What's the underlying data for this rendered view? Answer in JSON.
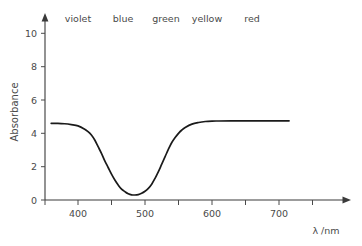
{
  "chart_data": {
    "type": "line",
    "title": "",
    "xlabel": "λ /nm",
    "ylabel": "Absorbance",
    "xlim": [
      355,
      760
    ],
    "ylim": [
      0,
      11
    ],
    "grid": false,
    "legend": null,
    "x_ticks": [
      400,
      500,
      600,
      700
    ],
    "x_tick_labels": [
      "400",
      "500",
      "600",
      "700"
    ],
    "x_minor_ticks": [
      350,
      450,
      550,
      650,
      750
    ],
    "y_ticks": [
      0,
      2,
      4,
      6,
      8,
      10
    ],
    "y_tick_labels": [
      "0",
      "2",
      "4",
      "6",
      "8",
      "10"
    ],
    "series": [
      {
        "name": "absorbance",
        "x": [
          360,
          370,
          380,
          390,
          400,
          410,
          415,
          420,
          425,
          430,
          435,
          440,
          445,
          450,
          455,
          460,
          465,
          470,
          475,
          480,
          485,
          490,
          495,
          500,
          505,
          510,
          515,
          520,
          525,
          530,
          535,
          540,
          545,
          550,
          555,
          560,
          570,
          580,
          590,
          600,
          610,
          630,
          660,
          690,
          715
        ],
        "y": [
          9.2,
          9.2,
          9.15,
          9.05,
          8.9,
          8.5,
          8.2,
          7.8,
          7.2,
          6.4,
          5.6,
          4.7,
          3.9,
          3.1,
          2.4,
          1.8,
          1.3,
          1.0,
          0.75,
          0.62,
          0.6,
          0.65,
          0.8,
          1.05,
          1.4,
          1.9,
          2.6,
          3.4,
          4.3,
          5.2,
          6.1,
          6.9,
          7.5,
          8.0,
          8.4,
          8.7,
          9.1,
          9.3,
          9.42,
          9.47,
          9.48,
          9.49,
          9.49,
          9.5,
          9.5
        ]
      }
    ],
    "annotations": [
      {
        "text": "violet",
        "x": 400,
        "y": 10.7
      },
      {
        "text": "blue",
        "x": 467,
        "y": 10.7
      },
      {
        "text": "green",
        "x": 524,
        "y": 10.7
      },
      {
        "text": "yellow",
        "x": 584,
        "y": 10.7
      },
      {
        "text": "red",
        "x": 660,
        "y": 10.7
      }
    ]
  },
  "axes": {
    "y_title": "Absorbance",
    "x_title": "λ /nm",
    "y_tick_labels": [
      "10",
      "8",
      "6",
      "4",
      "2",
      "0"
    ],
    "x_tick_labels": [
      "400",
      "500",
      "600",
      "700"
    ]
  },
  "bands": {
    "violet": "violet",
    "blue": "blue",
    "green": "green",
    "yellow": "yellow",
    "red": "red"
  },
  "colors": {
    "background": "#ffffff",
    "curve": "#1a1a1a",
    "axis": "#3a3a3a",
    "text": "#4a4a4a"
  }
}
